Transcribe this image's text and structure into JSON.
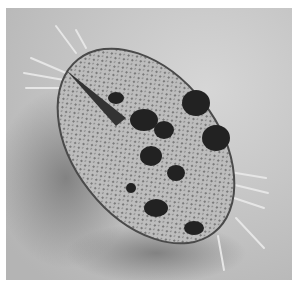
{
  "image": {
    "subject": "ciliate protozoan micrograph",
    "mode": "grayscale",
    "colors": {
      "background": "#c9c9c9",
      "shadow": "#8a8a8a",
      "cell_body": "#b8b8b8",
      "cell_outline": "#4a4a4a",
      "granules": "#5a5a5a",
      "dark_inclusions": "#1e1e1e",
      "cirri": "#eeeeee"
    }
  }
}
